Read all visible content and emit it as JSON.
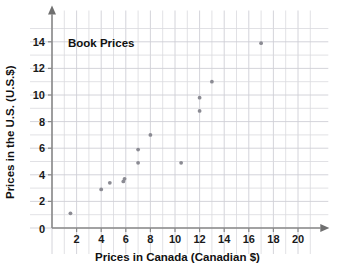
{
  "chart_data": {
    "type": "scatter",
    "title": "Book Prices",
    "xlabel": "Prices in Canada (Canadian $)",
    "ylabel": "Prices in the U.S. (U.S.$)",
    "xlim": [
      0,
      21
    ],
    "ylim": [
      0,
      15
    ],
    "xticks": [
      2,
      4,
      6,
      8,
      10,
      12,
      14,
      16,
      18,
      20
    ],
    "yticks": [
      2,
      4,
      6,
      8,
      10,
      12,
      14
    ],
    "x_origin_label": "0",
    "grid": true,
    "grid_step": 1,
    "legend": "none",
    "points": [
      {
        "x": 1.5,
        "y": 1.1
      },
      {
        "x": 4.0,
        "y": 2.9
      },
      {
        "x": 4.7,
        "y": 3.4
      },
      {
        "x": 5.8,
        "y": 3.5
      },
      {
        "x": 5.9,
        "y": 3.7
      },
      {
        "x": 7.0,
        "y": 4.9
      },
      {
        "x": 7.0,
        "y": 5.9
      },
      {
        "x": 8.0,
        "y": 7.0
      },
      {
        "x": 10.5,
        "y": 4.9
      },
      {
        "x": 12.0,
        "y": 8.8
      },
      {
        "x": 12.0,
        "y": 9.8
      },
      {
        "x": 13.0,
        "y": 11.0
      },
      {
        "x": 17.0,
        "y": 13.9
      }
    ],
    "colors": {
      "point": "#8b8b93",
      "grid": "#d9d9de",
      "axis": "#8a8a8a",
      "text": "#111111",
      "background": "#ffffff"
    }
  }
}
